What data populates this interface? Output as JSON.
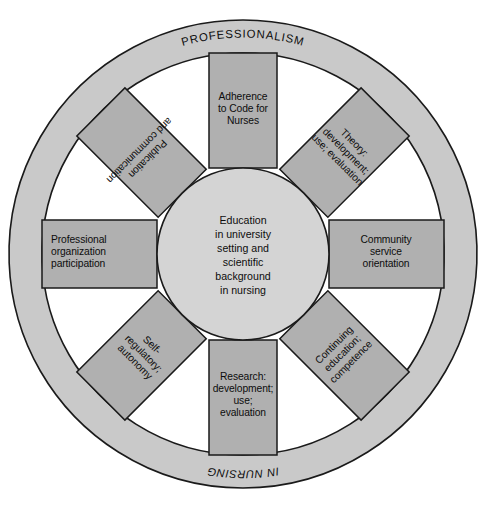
{
  "figure": {
    "caption_faint": "",
    "colors": {
      "outer_ring_fill": "#c9c9c9",
      "spoke_fill": "#b0b0b0",
      "hub_fill": "#d4d4d4",
      "background": "#ffffff",
      "stroke": "#1a1a1a",
      "text": "#0d0d0d"
    }
  },
  "outer_ring": {
    "top_label": "PROFESSIONALISM",
    "bottom_label": "IN NURSING"
  },
  "hub": {
    "lines": [
      "Education",
      "in university",
      "setting and",
      "scientific",
      "background",
      "in nursing"
    ]
  },
  "spokes": [
    {
      "id": "adherence-to-code",
      "position": "top",
      "angle_deg": 0,
      "align": "center",
      "lines": [
        "Adherence",
        "to Code for",
        "Nurses"
      ]
    },
    {
      "id": "theory-development",
      "position": "top-right",
      "angle_deg": 45,
      "align": "center",
      "lines": [
        "Theory:",
        "development;",
        "use; evaluation"
      ]
    },
    {
      "id": "community-service-orientation",
      "position": "right",
      "angle_deg": 90,
      "align": "center",
      "lines": [
        "Community",
        "service",
        "orientation"
      ]
    },
    {
      "id": "continuing-education",
      "position": "bottom-right",
      "angle_deg": 135,
      "align": "center",
      "lines": [
        "Continuing",
        "education;",
        "competence"
      ]
    },
    {
      "id": "research-development",
      "position": "bottom",
      "angle_deg": 180,
      "align": "center",
      "lines": [
        "Research:",
        "development;",
        "use;",
        "evaluation"
      ]
    },
    {
      "id": "self-regulatory-autonomy",
      "position": "bottom-left",
      "angle_deg": 225,
      "align": "center",
      "lines": [
        "Self-",
        "regulatory;",
        "autonomy"
      ]
    },
    {
      "id": "professional-organization-participation",
      "position": "left",
      "angle_deg": 270,
      "align": "left",
      "lines": [
        "Professional",
        "organization",
        "participation"
      ]
    },
    {
      "id": "publication-and-communication",
      "position": "top-left",
      "angle_deg": 315,
      "align": "center",
      "lines": [
        "Publication",
        "and communication"
      ]
    }
  ]
}
